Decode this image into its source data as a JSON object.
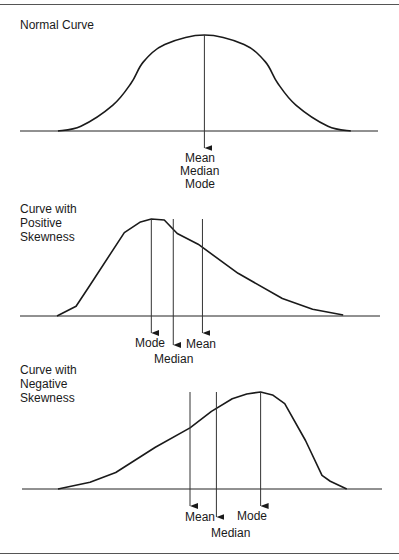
{
  "figure": {
    "panels": [
      {
        "id": "normal",
        "title_lines": [
          "Normal Curve"
        ],
        "curve_shape": "symmetric",
        "curve_points": [
          [
            0.0,
            0.0
          ],
          [
            0.075,
            0.05
          ],
          [
            0.18,
            0.27
          ],
          [
            0.24,
            0.5
          ],
          [
            0.28,
            0.72
          ],
          [
            0.35,
            0.9
          ],
          [
            0.48,
            1.0
          ],
          [
            0.61,
            0.9
          ],
          [
            0.68,
            0.72
          ],
          [
            0.72,
            0.5
          ],
          [
            0.78,
            0.27
          ],
          [
            0.885,
            0.05
          ],
          [
            0.96,
            0.0
          ]
        ],
        "markers": [
          {
            "name": "mean-median-mode",
            "position": 0.48,
            "labels": [
              "Mean",
              "Median",
              "Mode"
            ]
          }
        ]
      },
      {
        "id": "positive",
        "title_lines": [
          "Curve with",
          "Positive",
          "Skewness"
        ],
        "curve_shape": "right-skewed",
        "curve_points": [
          [
            0.0,
            0.0
          ],
          [
            0.053,
            0.1
          ],
          [
            0.092,
            0.32
          ],
          [
            0.187,
            0.86
          ],
          [
            0.232,
            0.97
          ],
          [
            0.262,
            1.0
          ],
          [
            0.298,
            0.99
          ],
          [
            0.334,
            0.85
          ],
          [
            0.392,
            0.74
          ],
          [
            0.503,
            0.44
          ],
          [
            0.626,
            0.18
          ],
          [
            0.71,
            0.07
          ],
          [
            0.795,
            0.01
          ]
        ],
        "markers": [
          {
            "name": "mode",
            "position": 0.262,
            "label": "Mode"
          },
          {
            "name": "median",
            "position": 0.323,
            "label": "Median"
          },
          {
            "name": "mean",
            "position": 0.404,
            "label": "Mean"
          }
        ]
      },
      {
        "id": "negative",
        "title_lines": [
          "Curve with",
          "Negative",
          "Skewness"
        ],
        "curve_shape": "left-skewed",
        "curve_points": [
          [
            0.0,
            0.0
          ],
          [
            0.097,
            0.07
          ],
          [
            0.175,
            0.17
          ],
          [
            0.295,
            0.43
          ],
          [
            0.4,
            0.63
          ],
          [
            0.465,
            0.8
          ],
          [
            0.528,
            0.93
          ],
          [
            0.572,
            0.98
          ],
          [
            0.614,
            1.0
          ],
          [
            0.65,
            0.97
          ],
          [
            0.687,
            0.88
          ],
          [
            0.75,
            0.5
          ],
          [
            0.8,
            0.14
          ],
          [
            0.825,
            0.08
          ],
          [
            0.875,
            0.0
          ]
        ],
        "markers": [
          {
            "name": "mean",
            "position": 0.4,
            "label": "Mean"
          },
          {
            "name": "median",
            "position": 0.48,
            "label": "Median"
          },
          {
            "name": "mode",
            "position": 0.614,
            "label": "Mode"
          }
        ]
      }
    ]
  }
}
